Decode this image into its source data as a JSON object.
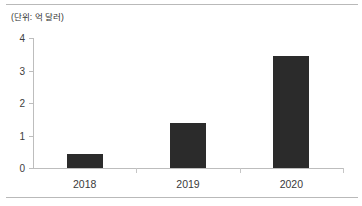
{
  "chart_data": {
    "type": "bar",
    "title": "",
    "subtitle": "",
    "unit_note": "(단위: 억 달러)",
    "categories": [
      "2018",
      "2019",
      "2020"
    ],
    "values": [
      0.43,
      1.4,
      3.45
    ],
    "series": [
      {
        "name": "",
        "values": [
          0.43,
          1.4,
          3.45
        ]
      }
    ],
    "xlabel": "",
    "ylabel": "",
    "ylim": [
      0,
      4
    ],
    "yticks": [
      "0",
      "1",
      "2",
      "3",
      "4"
    ],
    "ytick_values": [
      0,
      1,
      2,
      3,
      4
    ],
    "grid": false,
    "legend": false,
    "legend_position": "none",
    "bar_color": "#2b2b2b",
    "axis_color": "#bdbdbd",
    "text_color": "#3d3d3d",
    "background": "#ffffff"
  }
}
